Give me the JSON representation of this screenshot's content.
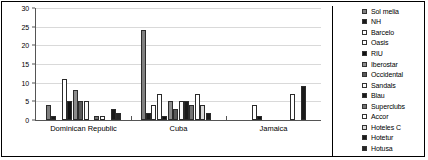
{
  "chart_data": {
    "type": "bar",
    "title": "",
    "subtitle": "",
    "xlabel": "",
    "ylabel": "",
    "ylim": [
      0,
      30
    ],
    "yticks": [
      0,
      5,
      10,
      15,
      20,
      25,
      30
    ],
    "grid": true,
    "legend_position": "right",
    "categories": [
      "Dominican Republic",
      "Cuba",
      "Jamaica"
    ],
    "series": [
      {
        "name": "Sol melia",
        "color": "#808080",
        "values": [
          4,
          24,
          0
        ]
      },
      {
        "name": "NH",
        "color": "#1a1a1a",
        "values": [
          1,
          2,
          0
        ]
      },
      {
        "name": "Barcelo",
        "color": "#ffffff",
        "values": [
          0,
          4,
          0
        ]
      },
      {
        "name": "Oasis",
        "color": "#ffffff",
        "values": [
          11,
          7,
          4
        ]
      },
      {
        "name": "RIU",
        "color": "#111111",
        "values": [
          5,
          1,
          1
        ]
      },
      {
        "name": "Iberostar",
        "color": "#8c8c8c",
        "values": [
          8,
          5,
          0
        ]
      },
      {
        "name": "Occidental",
        "color": "#595959",
        "values": [
          5,
          3,
          0
        ]
      },
      {
        "name": "Sandals",
        "color": "#fafafa",
        "values": [
          5,
          5,
          0
        ]
      },
      {
        "name": "Blau",
        "color": "#1a1a1a",
        "values": [
          0,
          5,
          0
        ]
      },
      {
        "name": "Superclubs",
        "color": "#737373",
        "values": [
          1,
          4,
          0
        ]
      },
      {
        "name": "Accor",
        "color": "#ffffff",
        "values": [
          1,
          7,
          7
        ]
      },
      {
        "name": "Hoteles C",
        "color": "#d9d9d9",
        "values": [
          0,
          4,
          0
        ]
      },
      {
        "name": "Hotetur",
        "color": "#1a1a1a",
        "values": [
          3,
          2,
          9
        ]
      },
      {
        "name": "Hotusa",
        "color": "#262626",
        "values": [
          2,
          0,
          0
        ]
      }
    ]
  }
}
